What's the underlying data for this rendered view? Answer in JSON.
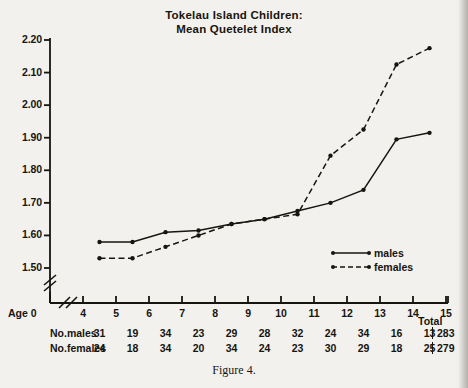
{
  "chart_data": {
    "type": "line",
    "title": "Tokelau Island Children: Mean Quetelet Index",
    "title_lines": [
      "Tokelau Island Children:",
      "Mean Quetelet Index"
    ],
    "xlabel": "Age",
    "ylabel": "",
    "x": [
      4.5,
      5.5,
      6.5,
      7.5,
      8.5,
      9.5,
      10.5,
      11.5,
      12.5,
      13.5,
      14.5
    ],
    "xlim": [
      4,
      15
    ],
    "ylim": [
      1.5,
      2.2
    ],
    "grid": false,
    "axis_break_x": true,
    "axis_break_y": true,
    "legend_position": "center-right",
    "series": [
      {
        "name": "males",
        "style": "solid",
        "marker": "dot",
        "values": [
          1.58,
          1.58,
          1.61,
          1.615,
          1.635,
          1.65,
          1.675,
          1.7,
          1.74,
          1.895,
          1.915
        ]
      },
      {
        "name": "females",
        "style": "dashed",
        "marker": "dot",
        "values": [
          1.53,
          1.53,
          1.565,
          1.6,
          1.635,
          1.65,
          1.665,
          1.845,
          1.925,
          2.125,
          2.175
        ]
      }
    ],
    "ytick_labels": [
      "2.20",
      "2.10",
      "2.00",
      "1.90",
      "1.80",
      "1.70",
      "1.60",
      "1.50"
    ],
    "ytick_values": [
      2.2,
      2.1,
      2.0,
      1.9,
      1.8,
      1.7,
      1.6,
      1.5
    ],
    "xtick_labels": [
      "4",
      "5",
      "6",
      "7",
      "8",
      "9",
      "10",
      "11",
      "12",
      "13",
      "14",
      "15"
    ],
    "xtick_values": [
      4,
      5,
      6,
      7,
      8,
      9,
      10,
      11,
      12,
      13,
      14,
      15
    ],
    "x_origin_label": "Age 0"
  },
  "legend": {
    "items": [
      {
        "label": "males"
      },
      {
        "label": "females"
      }
    ]
  },
  "table": {
    "total_header": "Total",
    "rows": [
      {
        "label": "No.males",
        "values": [
          "31",
          "19",
          "34",
          "23",
          "29",
          "28",
          "32",
          "24",
          "34",
          "16",
          "13"
        ],
        "total": "283"
      },
      {
        "label": "No.females",
        "values": [
          "24",
          "18",
          "34",
          "20",
          "34",
          "24",
          "23",
          "30",
          "29",
          "18",
          "25"
        ],
        "total": "279"
      }
    ]
  },
  "caption": "Figure 4.",
  "colors": {
    "ink": "#17150f",
    "paper": "#f3f1ee"
  }
}
